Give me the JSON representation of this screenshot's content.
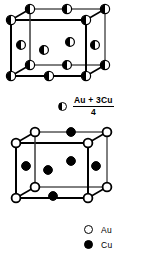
{
  "figure": {
    "colors": {
      "ink": "#000000",
      "paper": "#ffffff"
    }
  },
  "top_cell": {
    "name": "disordered-fcc-cell",
    "site_type": "half-filled",
    "description": "Disordered face-centred cubic cell; every site is a statistical average atom",
    "corner_sites": 8,
    "face_center_sites": 6
  },
  "bottom_cell": {
    "name": "ordered-cu3au-cell",
    "description": "Ordered cell with Au at corners and Cu at face centres",
    "corner_sites": 8,
    "face_center_sites": 6
  },
  "composition_legend": {
    "marker": "half-filled-circle",
    "numerator": "Au + 3Cu",
    "denominator": "4"
  },
  "atom_key": {
    "items": [
      {
        "marker": "open-circle",
        "label": "Au"
      },
      {
        "marker": "filled-circle",
        "label": "Cu"
      }
    ]
  }
}
